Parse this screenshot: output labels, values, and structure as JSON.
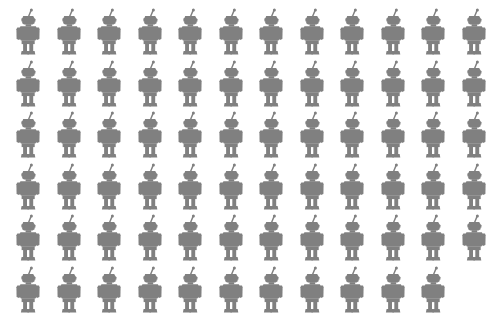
{
  "canvas": {
    "width": 495,
    "height": 332,
    "background_color": "#ffffff"
  },
  "pictogram": {
    "icon_name": "robot-icon",
    "description": "tin toy robot silhouette, front view, antenna on head",
    "fill_color": "#808080",
    "width": 36,
    "height": 48
  },
  "grid": {
    "columns": 12,
    "rows": 6,
    "column_spacing": 40.5,
    "row_spacing": 51.5,
    "origin_x": 10,
    "origin_y": 8,
    "total_count": 71,
    "full_rows": 5,
    "last_row_count": 11,
    "row_counts": [
      12,
      12,
      12,
      12,
      12,
      11
    ]
  },
  "chart_data": {
    "type": "pictogram",
    "title": "",
    "subtitle": "",
    "xlabel": "",
    "ylabel": "",
    "unit_symbol": "robot",
    "unit_value": 1,
    "total_units": 71,
    "categories": [
      "robots"
    ],
    "values": [
      71
    ],
    "legend": [],
    "annotations": [],
    "grid": false,
    "legend_position": "none"
  }
}
